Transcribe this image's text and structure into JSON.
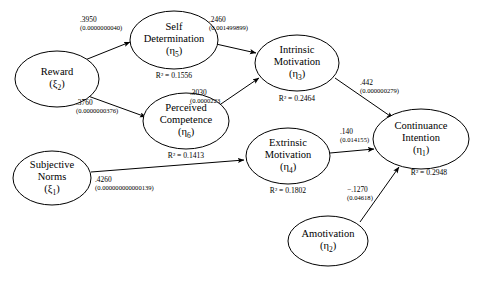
{
  "diagram": {
    "type": "structural-equation-model",
    "title": "",
    "nodes": [
      {
        "id": "reward",
        "name": "Reward",
        "greek": "ξ",
        "subscript": "2",
        "cx": 57,
        "cy": 79,
        "rx": 42,
        "ry": 28,
        "r2": null
      },
      {
        "id": "subjective-norms",
        "name": "Subjective Norms",
        "line1": "Subjective",
        "line2": "Norms",
        "greek": "ξ",
        "subscript": "1",
        "cx": 52,
        "cy": 178,
        "rx": 39,
        "ry": 27,
        "r2": null
      },
      {
        "id": "self-determination",
        "name": "Self Determination",
        "line1": "Self",
        "line2": "Determination",
        "greek": "η",
        "subscript": "5",
        "cx": 174,
        "cy": 40,
        "rx": 44,
        "ry": 29,
        "r2": "R² = 0.1556",
        "r2_value": 0.1556,
        "r2_x": 174,
        "r2_y": 78
      },
      {
        "id": "perceived-competence",
        "name": "Perceived Competence",
        "line1": "Perceived",
        "line2": "Competence",
        "greek": "η",
        "subscript": "6",
        "cx": 186,
        "cy": 121,
        "rx": 43,
        "ry": 28,
        "r2": "R² = 0.1413",
        "r2_value": 0.1413,
        "r2_x": 186,
        "r2_y": 158
      },
      {
        "id": "intrinsic-motivation",
        "name": "Intrinsic Motivation",
        "line1": "Intrinsic",
        "line2": "Motivation",
        "greek": "η",
        "subscript": "3",
        "cx": 297,
        "cy": 63,
        "rx": 42,
        "ry": 28,
        "r2": "R² = 0.2464",
        "r2_value": 0.2464,
        "r2_x": 297,
        "r2_y": 101
      },
      {
        "id": "extrinsic-motivation",
        "name": "Extrinsic Motivation",
        "line1": "Extrinsic",
        "line2": "Motivation",
        "greek": "η",
        "subscript": "4",
        "cx": 288,
        "cy": 156,
        "rx": 42,
        "ry": 28,
        "r2": "R² = 0.1802",
        "r2_value": 0.1802,
        "r2_x": 288,
        "r2_y": 193
      },
      {
        "id": "amotivation",
        "name": "Amotivation",
        "line1": "Amotivation",
        "line2": "",
        "greek": "η",
        "subscript": "2",
        "cx": 328,
        "cy": 241,
        "rx": 40,
        "ry": 25,
        "r2": null
      },
      {
        "id": "continuance-intention",
        "name": "Continuance Intention",
        "line1": "Continuance",
        "line2": "Intention",
        "greek": "η",
        "subscript": "1",
        "cx": 421,
        "cy": 139,
        "rx": 48,
        "ry": 30,
        "r2": "R² = 0.2948",
        "r2_value": 0.2948,
        "r2_x": 429,
        "r2_y": 175
      }
    ],
    "paths": [
      {
        "id": "reward-to-self-determination",
        "from": "reward",
        "to": "self-determination",
        "coefficient": ".3950",
        "coefficient_value": 0.395,
        "p_value": "(0.0000000040)",
        "label_x": 80,
        "label_y": 22,
        "x1": 85,
        "y1": 60,
        "x2": 130,
        "y2": 42
      },
      {
        "id": "reward-to-perceived-competence",
        "from": "reward",
        "to": "perceived-competence",
        "coefficient": ".3760",
        "coefficient_value": 0.376,
        "p_value": "(0.0000000376)",
        "label_x": 76,
        "label_y": 105,
        "x1": 88,
        "y1": 96,
        "x2": 146,
        "y2": 117
      },
      {
        "id": "self-determination-to-intrinsic-motivation",
        "from": "self-determination",
        "to": "intrinsic-motivation",
        "coefficient": ".2460",
        "coefficient_value": 0.246,
        "p_value": "(0.001499899)",
        "label_x": 209,
        "label_y": 22,
        "x1": 216,
        "y1": 44,
        "x2": 256,
        "y2": 53
      },
      {
        "id": "perceived-competence-to-intrinsic-motivation",
        "from": "perceived-competence",
        "to": "intrinsic-motivation",
        "coefficient": ".3030",
        "coefficient_value": 0.303,
        "p_value": "(0.0000223",
        "label_x": 190,
        "label_y": 95,
        "x1": 218,
        "y1": 106,
        "x2": 259,
        "y2": 78
      },
      {
        "id": "subjective-norms-to-extrinsic-motivation",
        "from": "subjective-norms",
        "to": "extrinsic-motivation",
        "coefficient": ".4260",
        "coefficient_value": 0.426,
        "p_value": "(0.000000000000139)",
        "label_x": 95,
        "label_y": 182,
        "x1": 91,
        "y1": 172,
        "x2": 244,
        "y2": 160
      },
      {
        "id": "intrinsic-motivation-to-continuance-intention",
        "from": "intrinsic-motivation",
        "to": "continuance-intention",
        "coefficient": ".442",
        "coefficient_value": 0.442,
        "p_value": "(0.000000279)",
        "label_x": 360,
        "label_y": 85,
        "x1": 335,
        "y1": 78,
        "x2": 393,
        "y2": 118
      },
      {
        "id": "extrinsic-motivation-to-continuance-intention",
        "from": "extrinsic-motivation",
        "to": "continuance-intention",
        "coefficient": ".140",
        "coefficient_value": 0.14,
        "p_value": "(0.014155)",
        "label_x": 340,
        "label_y": 134,
        "x1": 330,
        "y1": 153,
        "x2": 374,
        "y2": 149
      },
      {
        "id": "amotivation-to-continuance-intention",
        "from": "amotivation",
        "to": "continuance-intention",
        "coefficient": "−.1270",
        "coefficient_value": -0.127,
        "p_value": "(0.04618)",
        "label_x": 347,
        "label_y": 192,
        "x1": 360,
        "y1": 222,
        "x2": 399,
        "y2": 167
      }
    ]
  }
}
